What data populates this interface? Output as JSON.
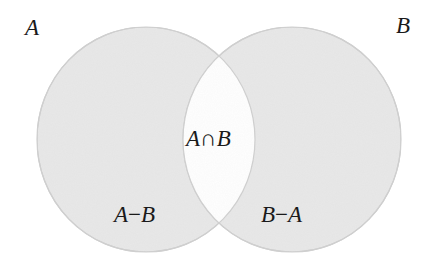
{
  "diagram": {
    "type": "venn",
    "sets": [
      {
        "id": "A",
        "label": "A"
      },
      {
        "id": "B",
        "label": "B"
      }
    ],
    "regions": {
      "intersection": {
        "left": "A",
        "op": "∩",
        "right": "B"
      },
      "a_minus_b": {
        "left": "A",
        "op": "−",
        "right": "B"
      },
      "b_minus_a": {
        "left": "B",
        "op": "−",
        "right": "A"
      }
    },
    "colors": {
      "set_fill": "#e8e8e8",
      "set_stroke": "#cfcfcf",
      "intersection_fill": "#ffffff",
      "text": "#1a1a1a"
    }
  }
}
